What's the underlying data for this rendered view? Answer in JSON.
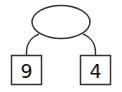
{
  "diagram": {
    "type": "number-bond",
    "whole": {
      "label": ""
    },
    "parts": [
      {
        "label": "9"
      },
      {
        "label": "4"
      }
    ],
    "colors": {
      "stroke": "#333333",
      "text": "#111111",
      "background": "#ffffff"
    }
  }
}
